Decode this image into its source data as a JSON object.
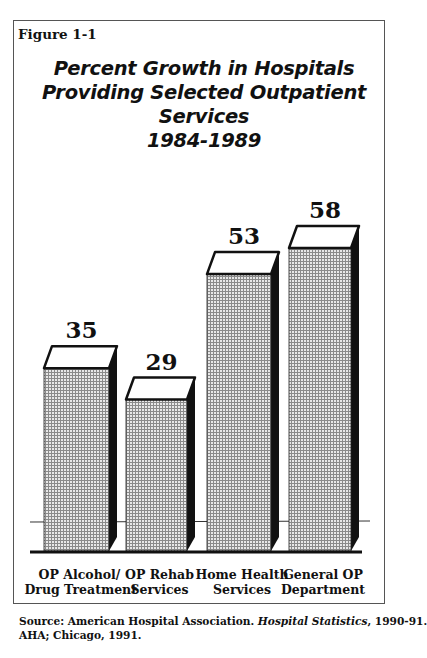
{
  "figure": {
    "label": "Figure 1-1",
    "title_lines": [
      "Percent Growth in Hospitals",
      "Providing Selected Outpatient",
      "Services",
      "1984-1989"
    ],
    "source": {
      "prefix": "Source: American Hospital Association. ",
      "publication": "Hospital Statistics",
      "suffix": ", 1990-91.",
      "line2": "AHA; Chicago, 1991."
    }
  },
  "chart_data": {
    "type": "bar",
    "title": "Percent Growth in Hospitals Providing Selected Outpatient Services 1984-1989",
    "categories": [
      "OP Alcohol/ Drug Treatment",
      "OP Rehab Services",
      "Home Health Services",
      "General OP Department"
    ],
    "category_lines": [
      [
        "OP Alcohol/",
        "Drug Treatment"
      ],
      [
        "OP Rehab",
        "Services"
      ],
      [
        "Home Health",
        "Services"
      ],
      [
        "General OP",
        "Department"
      ]
    ],
    "values": [
      35,
      29,
      53,
      58
    ],
    "value_labels": [
      "35",
      "29",
      "53",
      "58"
    ],
    "xlabel": "",
    "ylabel": "Percent growth",
    "ylim": [
      0,
      60
    ],
    "grid": false,
    "legend": null,
    "style": "3d-bar-stippled"
  }
}
